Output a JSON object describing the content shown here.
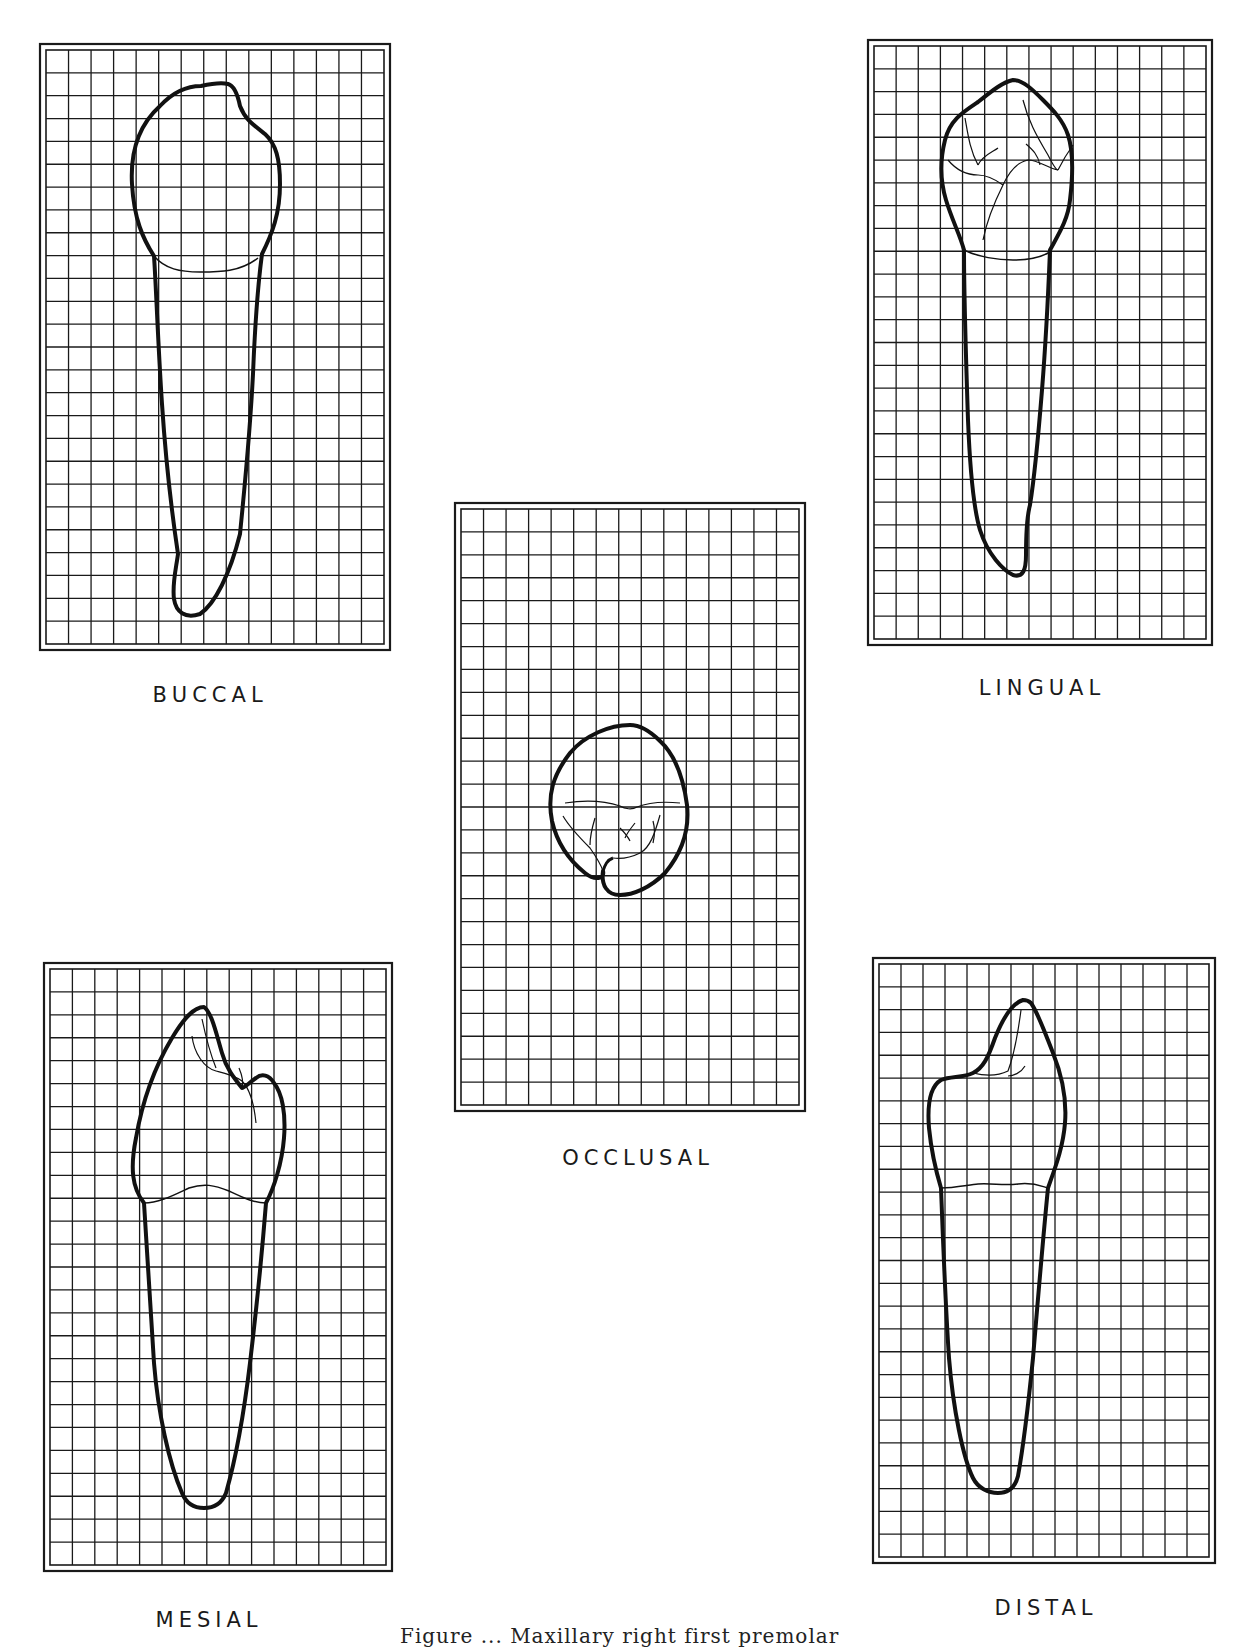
{
  "figure": {
    "caption_partial": "Figure ... Maxillary right first premolar",
    "grid_color": "#1a1a1a",
    "outline_color": "#111111",
    "background": "#ffffff"
  },
  "panels": [
    {
      "id": "buccal",
      "label": "BUCCAL",
      "x": 40,
      "y": 44,
      "w": 350,
      "h": 606,
      "cols": 15,
      "rows": 26,
      "label_x": 210,
      "label_y": 683
    },
    {
      "id": "lingual",
      "label": "LINGUAL",
      "x": 868,
      "y": 40,
      "w": 344,
      "h": 605,
      "cols": 15,
      "rows": 26,
      "label_x": 1042,
      "label_y": 676
    },
    {
      "id": "occlusal",
      "label": "OCCLUSAL",
      "x": 455,
      "y": 503,
      "w": 350,
      "h": 608,
      "cols": 15,
      "rows": 26,
      "label_x": 638,
      "label_y": 1146
    },
    {
      "id": "mesial",
      "label": "MESIAL",
      "x": 44,
      "y": 963,
      "w": 348,
      "h": 608,
      "cols": 15,
      "rows": 26,
      "label_x": 209,
      "label_y": 1608
    },
    {
      "id": "distal",
      "label": "DISTAL",
      "x": 873,
      "y": 958,
      "w": 342,
      "h": 605,
      "cols": 15,
      "rows": 26,
      "label_x": 1046,
      "label_y": 1596
    }
  ]
}
